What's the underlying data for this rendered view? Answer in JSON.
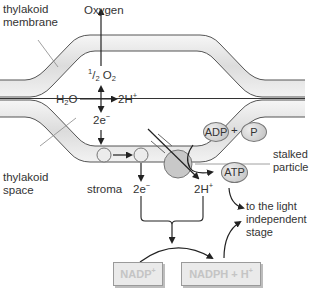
{
  "diagram": {
    "labels": {
      "thylakoid_membrane_1": "thylakoid",
      "thylakoid_membrane_2": "membrane",
      "thylakoid_space_1": "thylakoid",
      "thylakoid_space_2": "space",
      "oxygen": "Oxygen",
      "half_o2_num": "1",
      "half_o2_den": "2",
      "half_o2_main": "O",
      "half_o2_sub": "2",
      "h2o_main": "H",
      "h2o_sub": "2",
      "h2o_end": "O",
      "two_h_plus_top": "2H",
      "two_h_plus_top_sup": "+",
      "two_e_top": "2e",
      "two_e_top_sup": "−",
      "stroma": "stroma",
      "two_e_bottom": "2e",
      "two_e_bottom_sup": "−",
      "two_h_plus_bottom": "2H",
      "two_h_plus_bottom_sup": "+",
      "stalked_particle_1": "stalked",
      "stalked_particle_2": "particle",
      "to_light_independent_1": "to the light",
      "to_light_independent_2": "independent",
      "to_light_independent_3": "stage",
      "plus": "+"
    },
    "molecules": {
      "adp": "ADP",
      "p": "P",
      "atp": "ATP"
    },
    "boxes": {
      "nadp": "NADP",
      "nadp_sup": "+",
      "nadph": "NADPH + H",
      "nadph_sup": "+"
    },
    "colors": {
      "membrane_fill": "#e6e6e6",
      "membrane_edge": "#555555",
      "line": "#222222",
      "box_text": "#c4c4c4",
      "box_fill": "#eaeaea"
    }
  }
}
